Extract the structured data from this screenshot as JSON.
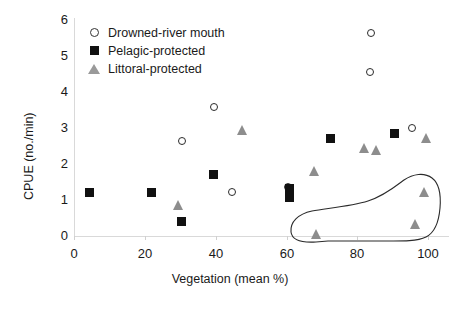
{
  "chart_data": {
    "type": "scatter",
    "title": "",
    "xlabel": "Vegetation (mean %)",
    "ylabel": "CPUE (no./min)",
    "xlim": [
      0,
      105
    ],
    "ylim": [
      0,
      6
    ],
    "xticks": [
      0,
      20,
      40,
      60,
      80,
      100
    ],
    "yticks": [
      0,
      1,
      2,
      3,
      4,
      5,
      6
    ],
    "grid": false,
    "legend_position": "top-left-inside",
    "annotations": [
      {
        "name": "encircled-cluster",
        "description": "hand-drawn closed outline enclosing three littoral-protected points in lower right"
      }
    ],
    "series": [
      {
        "name": "Drowned-river mouth",
        "marker": "open-circle",
        "color": "#2b2b2b",
        "points": [
          {
            "x": 30.5,
            "y": 2.65
          },
          {
            "x": 39.5,
            "y": 3.58
          },
          {
            "x": 44.5,
            "y": 1.22
          },
          {
            "x": 60.5,
            "y": 1.35
          },
          {
            "x": 84.0,
            "y": 5.65
          },
          {
            "x": 83.5,
            "y": 4.55
          },
          {
            "x": 95.5,
            "y": 3.0
          }
        ]
      },
      {
        "name": "Pelagic-protected",
        "marker": "filled-square",
        "color": "#111111",
        "points": [
          {
            "x": 4.5,
            "y": 1.2
          },
          {
            "x": 22.0,
            "y": 1.22
          },
          {
            "x": 30.5,
            "y": 0.4
          },
          {
            "x": 39.5,
            "y": 1.72
          },
          {
            "x": 61.0,
            "y": 1.33
          },
          {
            "x": 61.0,
            "y": 1.08
          },
          {
            "x": 72.5,
            "y": 2.7
          },
          {
            "x": 90.5,
            "y": 2.84
          }
        ]
      },
      {
        "name": "Littoral-protected",
        "marker": "open-triangle",
        "color": "#8d8d8d",
        "points": [
          {
            "x": 29.5,
            "y": 0.85
          },
          {
            "x": 47.5,
            "y": 2.95
          },
          {
            "x": 68.0,
            "y": 1.8
          },
          {
            "x": 82.0,
            "y": 2.45
          },
          {
            "x": 85.5,
            "y": 2.4
          },
          {
            "x": 99.5,
            "y": 2.72
          },
          {
            "x": 68.5,
            "y": 0.05
          },
          {
            "x": 99.0,
            "y": 1.22
          },
          {
            "x": 96.5,
            "y": 0.33
          }
        ]
      }
    ]
  },
  "axes": {
    "y_title": "CPUE (no./min)",
    "x_title": "Vegetation (mean %)",
    "y_tick_labels": [
      "6",
      "5",
      "4",
      "3",
      "2",
      "1",
      "0"
    ],
    "x_tick_labels": [
      "0",
      "20",
      "40",
      "60",
      "80",
      "100"
    ]
  },
  "legend": {
    "items": [
      {
        "label": "Drowned-river mouth",
        "marker": "open-circle-icon"
      },
      {
        "label": "Pelagic-protected",
        "marker": "filled-square-icon"
      },
      {
        "label": "Littoral-protected",
        "marker": "open-triangle-icon"
      }
    ]
  }
}
